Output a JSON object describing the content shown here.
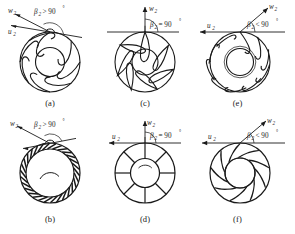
{
  "figure": {
    "type": "technical-diagram",
    "rows": 2,
    "columns": 3,
    "symbols": {
      "relative_velocity": "w",
      "relative_velocity_sub": "2",
      "blade_speed": "u",
      "blade_speed_sub": "2",
      "blade_angle": "β",
      "blade_angle_sub": "2",
      "degree": "°"
    },
    "colors": {
      "line": "#1a1a1a",
      "background": "#ffffff",
      "blade_fill": "#ffffff"
    },
    "panels": [
      {
        "id": "a",
        "caption": "(a)",
        "blade_type": "forward-curved",
        "angle_text": "> 90",
        "angle_relation": ">",
        "angle_value": "90",
        "angle_label": "β2 > 90°",
        "show_w": true,
        "show_u": true,
        "w_label": "w",
        "w_sub": "2",
        "u_label": "u",
        "u_sub": "2",
        "blade_count": 8,
        "ring_style": "wide",
        "w_direction": "up-left",
        "u_direction": "left"
      },
      {
        "id": "c",
        "caption": "(c)",
        "blade_type": "radial-tipped",
        "angle_text": "= 90",
        "angle_relation": "=",
        "angle_value": "90",
        "angle_label": "β2 = 90°",
        "show_w": true,
        "show_u": true,
        "w_label": "w",
        "w_sub": "2",
        "u_label": "u",
        "u_sub": "2",
        "blade_count": 7,
        "ring_style": "wide",
        "w_direction": "up",
        "u_direction": "left"
      },
      {
        "id": "e",
        "caption": "(e)",
        "blade_type": "backward-curved",
        "angle_text": "< 90",
        "angle_relation": "<",
        "angle_value": "90",
        "angle_label": "β2 < 90°",
        "show_w": true,
        "show_u": true,
        "w_label": "w",
        "w_sub": "2",
        "u_label": "u",
        "u_sub": "2",
        "blade_count": 10,
        "ring_style": "wide",
        "w_direction": "up-right",
        "u_direction": "left"
      },
      {
        "id": "b",
        "caption": "(b)",
        "blade_type": "forward-curved squirrel cage",
        "angle_text": "> 90",
        "angle_relation": ">",
        "angle_value": "90",
        "angle_label": "β2 > 90°",
        "show_w": true,
        "show_u": false,
        "w_label": "w",
        "w_sub": "2",
        "u_label": "u",
        "u_sub": "2",
        "blade_count": 30,
        "ring_style": "narrow",
        "w_direction": "up-left",
        "u_direction": "left"
      },
      {
        "id": "d",
        "caption": "(d)",
        "blade_type": "straight radial",
        "angle_text": "= 90",
        "angle_relation": "=",
        "angle_value": "90",
        "angle_label": "β2 = 90°",
        "show_w": true,
        "show_u": true,
        "w_label": "w",
        "w_sub": "2",
        "u_label": "u",
        "u_sub": "2",
        "blade_count": 8,
        "ring_style": "wide",
        "w_direction": "up",
        "u_direction": "left"
      },
      {
        "id": "f",
        "caption": "(f)",
        "blade_type": "backward-curved airfoil",
        "angle_text": "< 90",
        "angle_relation": "<",
        "angle_value": "90",
        "angle_label": "β2 < 90°",
        "show_w": true,
        "show_u": true,
        "w_label": "w",
        "w_sub": "2",
        "u_label": "u",
        "u_sub": "2",
        "blade_count": 9,
        "ring_style": "wide",
        "w_direction": "up-right",
        "u_direction": "left"
      }
    ]
  }
}
